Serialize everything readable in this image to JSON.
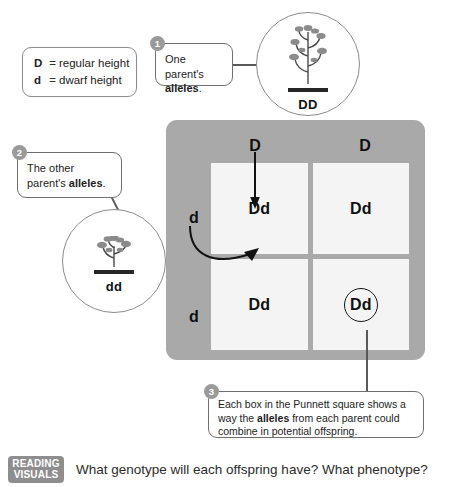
{
  "legend": {
    "name": "allele-key",
    "rows": [
      {
        "allele": "D",
        "equals": "=",
        "meaning": "regular height"
      },
      {
        "allele": "d",
        "equals": "=",
        "meaning": "dwarf height"
      }
    ]
  },
  "callouts": [
    {
      "number": "1",
      "text_before": "One parent's ",
      "text_bold": "alleles",
      "text_after": "."
    },
    {
      "number": "2",
      "text_before": "The other parent's ",
      "text_bold": "alleles",
      "text_after": "."
    },
    {
      "number": "3",
      "text_before": "Each box in the Punnett square shows a way the ",
      "text_bold": "alleles",
      "text_after": " from each parent could combine in potential offspring."
    }
  ],
  "parents": [
    {
      "icon": "tall-pea-plant-icon",
      "genotype": "DD",
      "height_type": "regular"
    },
    {
      "icon": "dwarf-pea-plant-icon",
      "genotype": "dd",
      "height_type": "dwarf"
    }
  ],
  "punnett": {
    "column_headers": [
      "D",
      "D"
    ],
    "row_headers": [
      "d",
      "d"
    ],
    "cells": [
      {
        "value": "Dd",
        "circled": false
      },
      {
        "value": "Dd",
        "circled": false
      },
      {
        "value": "Dd",
        "circled": false
      },
      {
        "value": "Dd",
        "circled": true
      }
    ],
    "panel_color": "#a9a9a9",
    "cell_color": "#f4f4f4"
  },
  "footer": {
    "badge_line1": "READING",
    "badge_line2": "VISUALS",
    "question": "What genotype will each offspring have? What phenotype?"
  }
}
